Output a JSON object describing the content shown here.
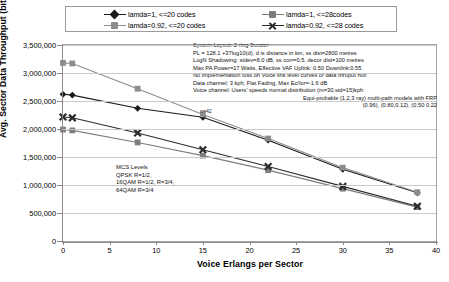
{
  "legend": {
    "entries": [
      {
        "label": "lamda=1, <=20 codes",
        "color": "#1a1a1a",
        "marker": "diamond",
        "col": "left"
      },
      {
        "label": "lamda=0.92, <=20 codes",
        "color": "#8c8c8c",
        "marker": "square",
        "col": "left"
      },
      {
        "label": "lamda=1, <=28codes",
        "color": "#7d7d7d",
        "marker": "square",
        "col": "right"
      },
      {
        "label": "lamda=0.92, <=28 codes",
        "color": "#2b2b2b",
        "marker": "cross",
        "col": "right"
      }
    ]
  },
  "notes": {
    "lines": [
      "System Layout: 2-ring 3sector",
      "PL = 128.1 +37log10(d), d is distance in km, ss dist=2800 metres",
      "LogN Shadowing: stdev=8.0 dB, ss corr=0.5, decor dist=100 metres",
      "Max PA Power=17 Watts,  Effective VAF Uplink: 0.50  Downlink:0.55",
      "No implementation loss on Voice link level curves or data thruput hull",
      "Data channel: 3 kph, Flat Fading, Max Ec/Ior=-1.6 dB",
      "Voice channel: Users' speeds normal distribution (m=30,std=15)kph"
    ],
    "right_lines": [
      "Equi-probable (1,2,3 ray) multi-path models with FRP",
      "(0.96), (0.80,0.12), (0.50 0.22"
    ]
  },
  "mcs": {
    "lines": [
      "MCS Levels",
      "QPSK R=1/2,",
      "16QAM R=1/2, R=3/4,",
      "64QAM R=3/4"
    ]
  },
  "point_label": "n=42",
  "chart_data": {
    "type": "line",
    "title": "",
    "xlabel": "Voice Erlangs per Sector",
    "ylabel": "Avg. Sector Data Throughput (bit/s)",
    "xlim": [
      0,
      40
    ],
    "ylim": [
      0,
      3500000
    ],
    "xticks": [
      0,
      5,
      10,
      15,
      20,
      25,
      30,
      35,
      40
    ],
    "yticks": [
      0,
      500000,
      1000000,
      1500000,
      2000000,
      2500000,
      3000000,
      3500000
    ],
    "ytick_labels": [
      "0",
      "500,000",
      "1,000,000",
      "1,500,000",
      "2,000,000",
      "2,500,000",
      "3,000,000",
      "3,500,000"
    ],
    "xtick_labels": [
      "0",
      "5",
      "10",
      "15",
      "20",
      "25",
      "30",
      "35",
      "40"
    ],
    "grid": "horizontal",
    "legend_position": "top",
    "x": [
      0,
      1,
      8,
      15,
      22,
      30,
      38
    ],
    "series": [
      {
        "name": "lamda=1, <=20 codes",
        "color": "#1a1a1a",
        "marker": "diamond",
        "values": [
          2620000,
          2605000,
          2370000,
          2210000,
          1800000,
          1280000,
          860000
        ]
      },
      {
        "name": "lamda=0.92, <=20 codes",
        "color": "#8c8c8c",
        "marker": "square",
        "values": [
          3180000,
          3170000,
          2720000,
          2260000,
          1830000,
          1310000,
          870000
        ]
      },
      {
        "name": "lamda=1, <=28codes",
        "color": "#7d7d7d",
        "marker": "square",
        "values": [
          1990000,
          1975000,
          1760000,
          1525000,
          1265000,
          935000,
          605000
        ]
      },
      {
        "name": "lamda=0.92, <=28 codes",
        "color": "#2b2b2b",
        "marker": "cross",
        "values": [
          2215000,
          2200000,
          1930000,
          1630000,
          1330000,
          975000,
          620000
        ]
      }
    ]
  }
}
